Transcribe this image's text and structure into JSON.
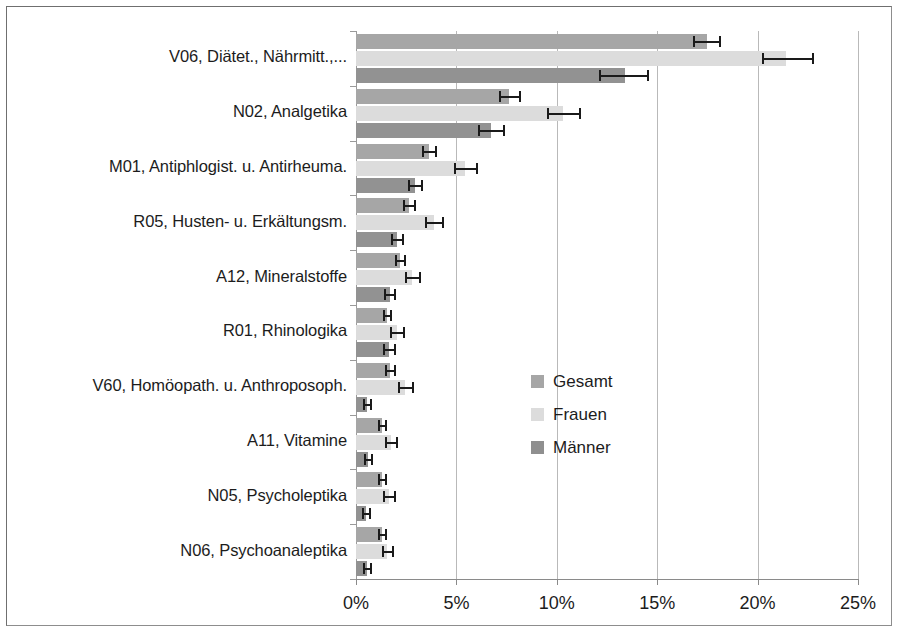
{
  "chart_data": {
    "type": "bar",
    "orientation": "horizontal",
    "title": "",
    "xlabel": "",
    "ylabel": "",
    "xlim": [
      0,
      25
    ],
    "xunit": "%",
    "grid": true,
    "legend_position": "center-right",
    "xticks": [
      "0%",
      "5%",
      "10%",
      "15%",
      "20%",
      "25%"
    ],
    "xtick_values": [
      0,
      5,
      10,
      15,
      20,
      25
    ],
    "categories": [
      "V06, Diätet., Nährmitt.,...",
      "N02, Analgetika",
      "M01, Antiphlogist. u. Antirheuma.",
      "R05, Husten- u. Erkältungsm.",
      "A12, Mineralstoffe",
      "R01, Rhinologika",
      "V60, Homöopath. u. Anthroposoph.",
      "A11, Vitamine",
      "N05, Psycholeptika",
      "N06, Psychoanaleptika"
    ],
    "series": [
      {
        "name": "Gesamt",
        "color": "#a6a6a6",
        "values": [
          17.5,
          7.6,
          3.65,
          2.65,
          2.2,
          1.55,
          1.7,
          1.3,
          1.3,
          1.3
        ],
        "err_low": [
          16.8,
          7.1,
          3.3,
          2.35,
          1.95,
          1.35,
          1.45,
          1.1,
          1.1,
          1.1
        ],
        "err_high": [
          18.2,
          8.2,
          4.05,
          3.0,
          2.5,
          1.8,
          2.0,
          1.55,
          1.55,
          1.55
        ]
      },
      {
        "name": "Frauen",
        "color": "#dcdcdc",
        "values": [
          21.4,
          10.3,
          5.45,
          3.9,
          2.8,
          2.05,
          2.45,
          1.75,
          1.65,
          1.55
        ],
        "err_low": [
          20.2,
          9.5,
          4.9,
          3.45,
          2.45,
          1.7,
          2.1,
          1.45,
          1.35,
          1.3
        ],
        "err_high": [
          22.8,
          11.2,
          6.1,
          4.4,
          3.25,
          2.45,
          2.9,
          2.1,
          2.0,
          1.9
        ]
      },
      {
        "name": "Männer",
        "color": "#929292",
        "values": [
          13.4,
          6.7,
          2.95,
          2.05,
          1.7,
          1.65,
          0.55,
          0.6,
          0.5,
          0.55
        ],
        "err_low": [
          12.1,
          6.1,
          2.6,
          1.75,
          1.4,
          1.35,
          0.35,
          0.4,
          0.3,
          0.35
        ],
        "err_high": [
          14.6,
          7.4,
          3.35,
          2.4,
          2.0,
          2.0,
          0.8,
          0.85,
          0.75,
          0.8
        ]
      }
    ]
  },
  "legend": {
    "items": [
      {
        "label": "Gesamt"
      },
      {
        "label": "Frauen"
      },
      {
        "label": "Männer"
      }
    ]
  }
}
